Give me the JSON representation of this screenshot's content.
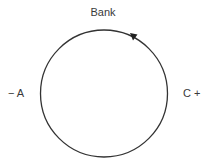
{
  "diagram": {
    "type": "cycle",
    "labels": {
      "top": "Bank",
      "left": "− A",
      "right": "C +"
    },
    "circle": {
      "cx": 104,
      "cy": 93.5,
      "r": 63.5,
      "stroke": "#333333"
    },
    "arrow": {
      "direction": "counter-clockwise",
      "position": "upper-right",
      "color": "#222222"
    }
  }
}
